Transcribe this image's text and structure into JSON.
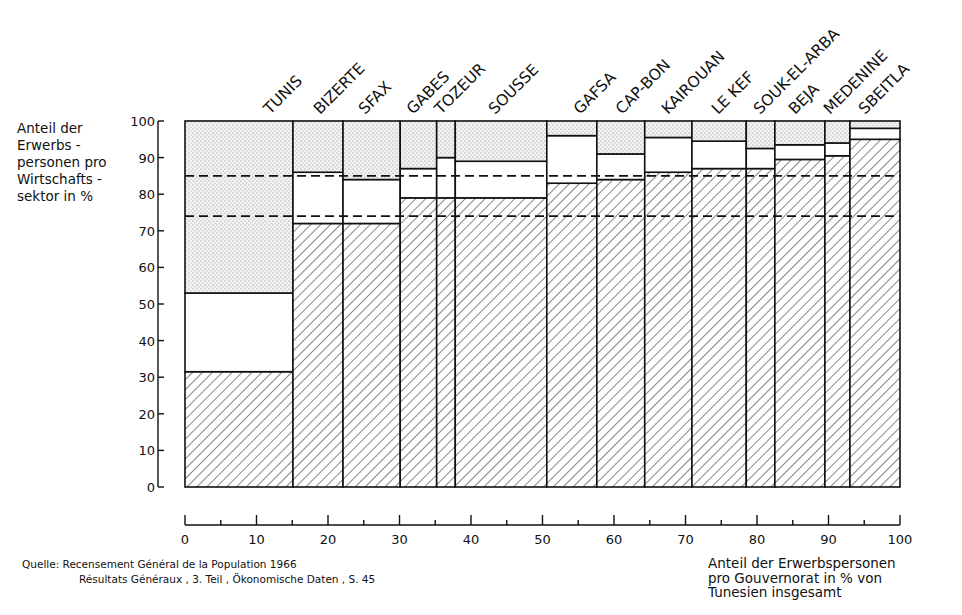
{
  "chart_data": {
    "type": "bar",
    "subtype": "variable-width stacked bar (mosaic)",
    "title": "",
    "ylabel": "Anteil der Erwerbspersonen pro Wirtschaftssektor in %",
    "ylabel_lines": [
      "Anteil der",
      "Erwerbs -",
      "personen pro",
      "Wirtschafts -",
      "sektor in %"
    ],
    "xlabel": "Anteil der Erwerbspersonen pro Gouvernorat in % von Tunesien insgesamt",
    "xlabel_lines": [
      "Anteil der Erwerbspersonen",
      "pro Gouvernorat in % von",
      "Tunesien  insgesamt"
    ],
    "xlim": [
      0,
      100
    ],
    "ylim": [
      0,
      100
    ],
    "x_ticks": [
      0,
      10,
      20,
      30,
      40,
      50,
      60,
      70,
      80,
      90,
      100
    ],
    "x_minor_ticks": [
      5,
      15,
      25,
      35,
      45,
      55,
      65,
      75,
      85,
      95
    ],
    "y_ticks": [
      0,
      10,
      20,
      30,
      40,
      50,
      60,
      70,
      80,
      90,
      100
    ],
    "grid": false,
    "legend": "none (patterns: hatched = lower sector, blank = middle sector, dotted = upper sector)",
    "sector_patterns": [
      "hatched",
      "blank",
      "dotted"
    ],
    "categories": [
      "TUNIS",
      "BIZERTE",
      "SFAX",
      "GABES",
      "TOZEUR",
      "SOUSSE",
      "GAFSA",
      "CAP-BON",
      "KAIROUAN",
      "LE KEF",
      "SOUK-EL-ARBA",
      "BEJA",
      "MEDENINE",
      "SBEITLA"
    ],
    "x_boundaries": [
      0,
      15.1,
      22.1,
      30.1,
      35.2,
      37.8,
      50.6,
      57.6,
      64.3,
      70.9,
      78.5,
      82.5,
      89.5,
      93.0,
      100
    ],
    "series": [
      {
        "name": "hatched (bottom sector)",
        "pattern": "hatched",
        "values": [
          31.5,
          72,
          72,
          79,
          79,
          79,
          83,
          84,
          86,
          87,
          87,
          89.5,
          90.5,
          95
        ]
      },
      {
        "name": "blank (middle sector)",
        "pattern": "blank",
        "values": [
          21.5,
          14,
          12,
          8,
          11,
          10,
          13,
          7,
          9.5,
          7.5,
          5.5,
          4,
          3.5,
          3
        ]
      },
      {
        "name": "dotted (top sector)",
        "pattern": "dotted",
        "values": [
          47,
          14,
          16,
          13,
          10,
          11,
          4,
          9,
          4.5,
          5.5,
          7.5,
          6.5,
          6,
          2
        ]
      }
    ],
    "reference_lines": [
      {
        "style": "dashed",
        "y": 74
      },
      {
        "style": "dashed",
        "y": 85
      }
    ]
  },
  "source": {
    "label": "Quelle:",
    "line1": "Recensement Général de la Population 1966",
    "line2": "Résultats Généraux , 3. Teil , Ökonomische Daten , S. 45"
  }
}
